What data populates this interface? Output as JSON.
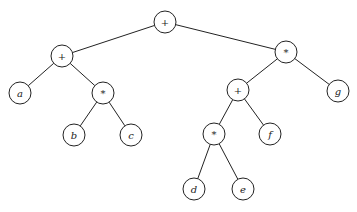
{
  "diagram": {
    "type": "expression-tree",
    "node_radius": 11,
    "nodes": [
      {
        "id": "n0",
        "label": "+",
        "kind": "op",
        "x": 165,
        "y": 22
      },
      {
        "id": "n1",
        "label": "+",
        "kind": "op",
        "x": 62,
        "y": 56
      },
      {
        "id": "n2",
        "label": "*",
        "kind": "op",
        "x": 286,
        "y": 52
      },
      {
        "id": "n3",
        "label": "a",
        "kind": "var",
        "x": 20,
        "y": 93
      },
      {
        "id": "n4",
        "label": "*",
        "kind": "op",
        "x": 103,
        "y": 93
      },
      {
        "id": "n5",
        "label": "b",
        "kind": "var",
        "x": 74,
        "y": 135
      },
      {
        "id": "n6",
        "label": "c",
        "kind": "var",
        "x": 131,
        "y": 135
      },
      {
        "id": "n7",
        "label": "+",
        "kind": "op",
        "x": 238,
        "y": 90
      },
      {
        "id": "n8",
        "label": "g",
        "kind": "var",
        "x": 338,
        "y": 91
      },
      {
        "id": "n9",
        "label": "*",
        "kind": "op",
        "x": 214,
        "y": 134
      },
      {
        "id": "n10",
        "label": "f",
        "kind": "var",
        "x": 270,
        "y": 134
      },
      {
        "id": "n11",
        "label": "d",
        "kind": "var",
        "x": 194,
        "y": 189
      },
      {
        "id": "n12",
        "label": "e",
        "kind": "var",
        "x": 243,
        "y": 189
      }
    ],
    "edges": [
      [
        "n0",
        "n1"
      ],
      [
        "n0",
        "n2"
      ],
      [
        "n1",
        "n3"
      ],
      [
        "n1",
        "n4"
      ],
      [
        "n4",
        "n5"
      ],
      [
        "n4",
        "n6"
      ],
      [
        "n2",
        "n7"
      ],
      [
        "n2",
        "n8"
      ],
      [
        "n7",
        "n9"
      ],
      [
        "n7",
        "n10"
      ],
      [
        "n9",
        "n11"
      ],
      [
        "n9",
        "n12"
      ]
    ]
  }
}
